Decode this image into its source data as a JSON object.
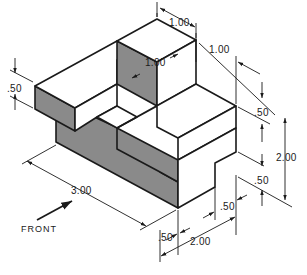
{
  "figure": {
    "type": "isometric technical drawing",
    "colors": {
      "line": "#1a1a1a",
      "shaded_face": "#8a8a8a",
      "background": "#ffffff"
    }
  },
  "dimensions": {
    "top_depth_tall_block": "1.00",
    "tall_block_width": "1.00",
    "right_top_offset": "1.00",
    "left_slab_height": ".50",
    "right_upper_step": ".50",
    "overall_height": "2.00",
    "right_lower_step": ".50",
    "bottom_notch_width": ".50",
    "front_notch_width": ".50",
    "overall_depth": "2.00",
    "overall_length": "3.00"
  },
  "front_label": "FRONT"
}
